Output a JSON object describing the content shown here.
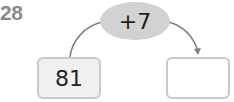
{
  "question_number": "28",
  "operation": "+7",
  "start_value": "81",
  "answer_value": "",
  "colors": {
    "oval_fill": "#d2d2d2",
    "box_border": "#c9c9c9",
    "left_box_fill": "#f0f0f0",
    "arrow": "#808080",
    "number_gray": "#8a8a8a"
  }
}
